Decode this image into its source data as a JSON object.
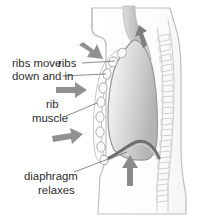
{
  "diagram": {
    "background_color": "#ffffff",
    "outline_color": "#b9b9b9",
    "arrow_color": "#8c8c8c",
    "text_color": "#2b2b2b",
    "lung_fill_light": "#f2f2f2",
    "lung_fill_dark": "#b6b6b6",
    "diaphragm_color": "#6f6f6f"
  },
  "labels": {
    "ribs_move": {
      "line1": "ribs move",
      "line2": "down and in"
    },
    "ribs": "ribs",
    "rib_muscle": {
      "line1": "rib",
      "line2": "muscle"
    },
    "diaphragm": {
      "line1": "diaphragm",
      "line2": "relaxes"
    }
  },
  "arrows": [
    {
      "name": "rib-arrow-top",
      "direction": "down-right",
      "meaning": "ribs move down and in"
    },
    {
      "name": "rib-arrow-middle",
      "direction": "right",
      "meaning": "ribs move down and in"
    },
    {
      "name": "rib-arrow-lower",
      "direction": "right",
      "meaning": "ribs move down and in"
    },
    {
      "name": "diaphragm-arrow",
      "direction": "up",
      "meaning": "diaphragm moves up"
    },
    {
      "name": "airflow-arrow",
      "direction": "up",
      "meaning": "air flows out through trachea"
    }
  ],
  "structures": [
    {
      "name": "lung",
      "label": "lung"
    },
    {
      "name": "rib-chain",
      "label": "ribs",
      "count": 8
    },
    {
      "name": "intercostal-muscle",
      "label": "rib muscle"
    },
    {
      "name": "diaphragm",
      "label": "diaphragm"
    },
    {
      "name": "spine",
      "label": "spine",
      "vertebrae": 13
    },
    {
      "name": "trachea",
      "label": "trachea"
    },
    {
      "name": "body-outline",
      "label": "torso"
    }
  ]
}
